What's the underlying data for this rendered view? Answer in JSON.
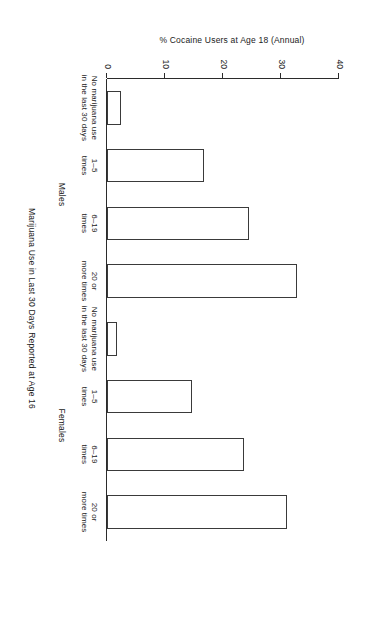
{
  "chart_data": {
    "type": "bar",
    "title": "",
    "xlabel": "Marijuana Use in Last 30 Days Reported at Age 16",
    "ylabel": "% Cocaine Users at Age 18 (Annual)",
    "ylim": [
      0,
      40
    ],
    "yticks": [
      "0",
      "10",
      "20",
      "30",
      "40"
    ],
    "ytick_values": [
      0,
      10,
      20,
      30,
      40
    ],
    "grid": false,
    "legend": "none",
    "orientation": "vertical-bars-rotated-page",
    "groups": [
      "Males",
      "Females"
    ],
    "categories": [
      "No marijuana use\nin the last 30 days",
      "1–5\ntimes",
      "6–19\ntimes",
      "20 or\nmore times"
    ],
    "series": [
      {
        "name": "Males",
        "values": [
          2.5,
          16.7,
          24.5,
          32.7
        ]
      },
      {
        "name": "Females",
        "values": [
          1.7,
          14.7,
          23.7,
          31.0
        ]
      }
    ],
    "bars": [
      {
        "group": "Males",
        "category": "No marijuana use\nin the last 30 days",
        "value": 2.5
      },
      {
        "group": "Males",
        "category": "1–5\ntimes",
        "value": 16.7
      },
      {
        "group": "Males",
        "category": "6–19\ntimes",
        "value": 24.5
      },
      {
        "group": "Males",
        "category": "20 or\nmore times",
        "value": 32.7
      },
      {
        "group": "Females",
        "category": "No marijuana use\nin the last 30 days",
        "value": 1.7
      },
      {
        "group": "Females",
        "category": "1–5\ntimes",
        "value": 14.7
      },
      {
        "group": "Females",
        "category": "6–19\ntimes",
        "value": 23.7
      },
      {
        "group": "Females",
        "category": "20 or\nmore times",
        "value": 31.0
      }
    ],
    "colors": {
      "bar_fill": "#ffffff",
      "bar_stroke": "#3a3a3a",
      "axis": "#2b2b2b",
      "text": "#1a1a1a",
      "background": "#ffffff"
    }
  }
}
